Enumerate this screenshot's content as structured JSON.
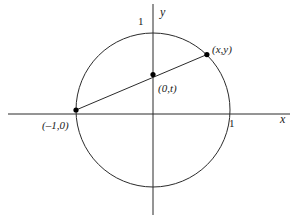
{
  "figure": {
    "background_color": "#ffffff",
    "stroke_color": "#2b2b2b",
    "dot_color": "#000000",
    "width": 304,
    "height": 223
  },
  "axes": {
    "x_label": "x",
    "y_label": "y",
    "x_tick_label": "1",
    "y_tick_label": "1",
    "origin_px": {
      "x": 153,
      "y": 114
    },
    "x_axis_from_px": 8,
    "x_axis_to_px": 290,
    "y_axis_from_px": 4,
    "y_axis_to_px": 215
  },
  "labels": {
    "point_left": "(–1,0)",
    "point_center": "(0,t)",
    "point_circle": "(x,y)"
  },
  "chart_data": {
    "type": "scatter",
    "title": "",
    "xlabel": "x",
    "ylabel": "y",
    "grid": false,
    "legend": null,
    "xlim": [
      -1.86,
      1.76
    ],
    "ylim": [
      -1.3,
      1.41
    ],
    "shapes": [
      {
        "kind": "circle",
        "label": "unit circle",
        "center": [
          0,
          0
        ],
        "radius": 1
      },
      {
        "kind": "line",
        "label": "secant line through (-1,0) and (x,y)",
        "from": [
          -1,
          0
        ],
        "to": [
          0.7,
          0.72
        ]
      }
    ],
    "points": [
      {
        "label": "(–1,0)",
        "x": -1,
        "y": 0
      },
      {
        "label": "(0,t)",
        "x": 0,
        "y": 0.46
      },
      {
        "label": "(x,y)",
        "x": 0.7,
        "y": 0.72
      }
    ],
    "xticks": [
      1
    ],
    "xtick_labels": [
      "1"
    ],
    "yticks": [
      1
    ],
    "ytick_labels": [
      "1"
    ]
  }
}
